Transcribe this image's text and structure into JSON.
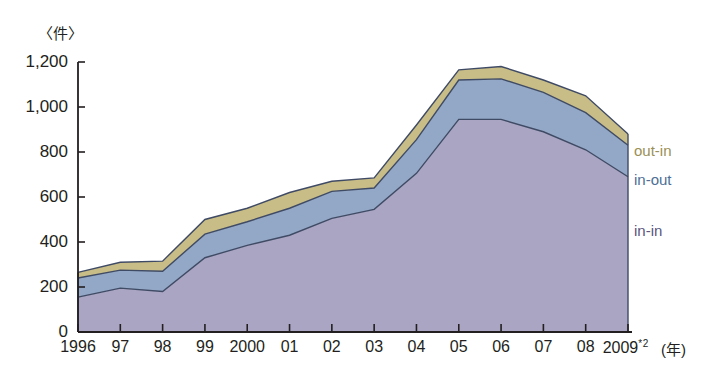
{
  "axis": {
    "unit_label": "〈件〉",
    "x_axis_title": "(年)",
    "y_ticks": [
      "1,200",
      "1,000",
      "800",
      "600",
      "400",
      "200",
      "0"
    ],
    "x_tick_labels": [
      "1996",
      "97",
      "98",
      "99",
      "2000",
      "01",
      "02",
      "03",
      "04",
      "05",
      "06",
      "07",
      "08",
      "2009"
    ],
    "x_last_superscript": "*2"
  },
  "series_labels": {
    "out_in": "out-in",
    "in_out": "in-out",
    "in_in": "in-in"
  },
  "colors": {
    "out_in": "#c8bd87",
    "in_out": "#93a8c6",
    "in_in": "#a9a5c2",
    "line": "#3f4a64",
    "axis": "#231f20",
    "background": "#ffffff"
  },
  "caption": "",
  "chart_data": {
    "type": "area",
    "title": "",
    "subtitle": "",
    "xlabel": "(年)",
    "ylabel": "〈件〉",
    "stacked": true,
    "grid": false,
    "legend_position": "right-inline",
    "ylim": [
      0,
      1200
    ],
    "ytick_values": [
      0,
      200,
      400,
      600,
      800,
      1000,
      1200
    ],
    "categories": [
      "1996",
      "1997",
      "1998",
      "1999",
      "2000",
      "2001",
      "2002",
      "2003",
      "2004",
      "2005",
      "2006",
      "2007",
      "2008",
      "2009"
    ],
    "series": [
      {
        "name": "in-in",
        "values": [
          155,
          195,
          180,
          330,
          385,
          430,
          505,
          545,
          705,
          945,
          945,
          890,
          810,
          690
        ]
      },
      {
        "name": "in-out",
        "values": [
          85,
          80,
          90,
          105,
          105,
          120,
          120,
          95,
          150,
          175,
          180,
          175,
          165,
          140
        ]
      },
      {
        "name": "out-in",
        "values": [
          25,
          35,
          45,
          65,
          60,
          70,
          45,
          45,
          65,
          45,
          55,
          55,
          75,
          50
        ]
      }
    ],
    "cumulative_totals": [
      265,
      310,
      315,
      500,
      550,
      620,
      670,
      685,
      920,
      1165,
      1180,
      1120,
      1050,
      880
    ]
  }
}
